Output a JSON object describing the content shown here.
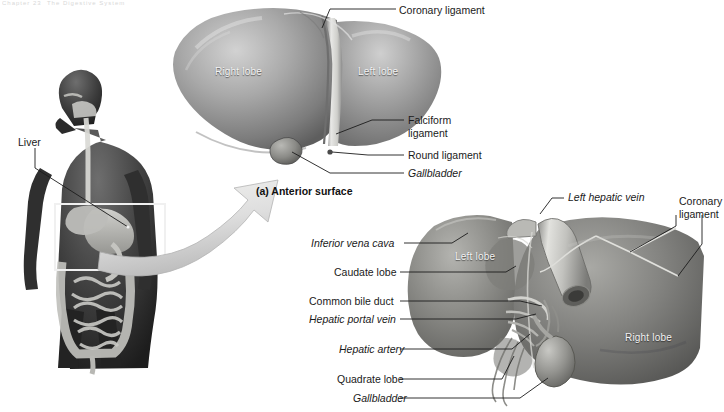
{
  "figure": {
    "top_fragment": "Chapter 23  The Digestive System",
    "panel_a_caption": "(a) Anterior surface"
  },
  "body_panel": {
    "liver_label": "Liver"
  },
  "panel_a": {
    "organ_labels": [
      {
        "text": "Right lobe",
        "x": 215,
        "y": 66
      },
      {
        "text": "Left lobe",
        "x": 358,
        "y": 66
      }
    ],
    "callouts": [
      {
        "text": "Coronary ligament",
        "x": 399,
        "y": 4,
        "italic": false
      },
      {
        "text": "Falciform",
        "x": 408,
        "y": 117,
        "italic": false
      },
      {
        "text": "ligament",
        "x": 408,
        "y": 130,
        "italic": false
      },
      {
        "text": "Round ligament",
        "x": 408,
        "y": 152,
        "italic": false
      },
      {
        "text": "Gallbladder",
        "x": 408,
        "y": 171,
        "italic": true
      }
    ]
  },
  "panel_b": {
    "organ_labels": [
      {
        "text": "Left lobe",
        "x": 455,
        "y": 251
      },
      {
        "text": "Right lobe",
        "x": 625,
        "y": 332
      }
    ],
    "callouts_left": [
      {
        "text": "Inferior vena cava",
        "x": 311,
        "y": 239,
        "italic": true
      },
      {
        "text": "Caudate lobe",
        "x": 334,
        "y": 268,
        "italic": false
      },
      {
        "text": "Common bile duct",
        "x": 309,
        "y": 297,
        "italic": false
      },
      {
        "text": "Hepatic portal vein",
        "x": 309,
        "y": 315,
        "italic": true
      },
      {
        "text": "Hepatic artery",
        "x": 339,
        "y": 345,
        "italic": true
      },
      {
        "text": "Quadrate lobe",
        "x": 337,
        "y": 375,
        "italic": false
      },
      {
        "text": "Gallbladder",
        "x": 353,
        "y": 394,
        "italic": true
      }
    ],
    "callouts_right": [
      {
        "text": "Left hepatic vein",
        "x": 568,
        "y": 193,
        "italic": true
      },
      {
        "text": "Coronary",
        "x": 679,
        "y": 197,
        "italic": false
      },
      {
        "text": "ligament",
        "x": 679,
        "y": 210,
        "italic": false
      }
    ]
  },
  "colors": {
    "organ_mid": "#8d8d8d",
    "organ_light": "#c9c9c9",
    "organ_dark": "#5a5a5a",
    "leader": "#1c1c1c",
    "background": "#ffffff"
  }
}
